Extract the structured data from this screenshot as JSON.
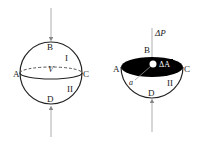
{
  "left_figure": {
    "labels": {
      "top": "B",
      "left": "A",
      "right": "C",
      "bottom": "D",
      "upper_region": "I",
      "lower_region": "II",
      "volume": "V"
    }
  },
  "right_figure": {
    "labels": {
      "top": "B",
      "left": "A",
      "right": "C",
      "bottom": "D",
      "lower_region": "II",
      "force": "ΔP",
      "area": "ΔA",
      "point": "a"
    }
  },
  "colors": {
    "stroke": "#222222",
    "fill_section": "#000000",
    "axis_line": "#999999"
  }
}
